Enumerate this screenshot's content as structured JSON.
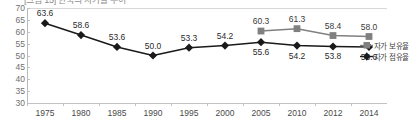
{
  "chart_data": {
    "type": "line",
    "title": "[그림 15] 한국의 자가율 추이",
    "xlabel": "",
    "ylabel": "",
    "ylim": [
      30,
      70
    ],
    "yticks": [
      30,
      35,
      40,
      45,
      50,
      55,
      60,
      65,
      70
    ],
    "grid": false,
    "legend_position": "right",
    "categories": [
      "1975",
      "1980",
      "1985",
      "1990",
      "1995",
      "2000",
      "2005",
      "2010",
      "2012",
      "2014"
    ],
    "series": [
      {
        "name": "자가 보유율",
        "marker": "square",
        "color": "#808080",
        "values": [
          null,
          null,
          null,
          null,
          null,
          null,
          60.3,
          61.3,
          58.4,
          58.0
        ],
        "label_position": "above"
      },
      {
        "name": "자가 점유율",
        "marker": "diamond",
        "color": "#1a1a1a",
        "values": [
          63.6,
          58.6,
          53.6,
          50.0,
          53.3,
          54.2,
          55.6,
          54.2,
          53.8,
          53.6
        ],
        "label_position": "mixed"
      }
    ],
    "point_labels": {
      "ownership": [
        "",
        "",
        "",
        "",
        "",
        "",
        "60.3",
        "61.3",
        "58.4",
        "58.0"
      ],
      "occupancy": [
        "63.6",
        "58.6",
        "53.6",
        "50.0",
        "53.3",
        "54.2",
        "55.6",
        "54.2",
        "53.8",
        "53.6"
      ]
    }
  },
  "legend": {
    "items": [
      {
        "label": "자가 보유율",
        "marker": "square-marker",
        "color": "#808080"
      },
      {
        "label": "자가 점유율",
        "marker": "diamond-marker",
        "color": "#1a1a1a"
      }
    ]
  },
  "axes": {
    "y_tick_labels": [
      "70",
      "65",
      "60",
      "55",
      "50",
      "45",
      "40",
      "35",
      "30"
    ],
    "x_tick_labels": [
      "1975",
      "1980",
      "1985",
      "1990",
      "1995",
      "2000",
      "2005",
      "2010",
      "2012",
      "2014"
    ]
  }
}
